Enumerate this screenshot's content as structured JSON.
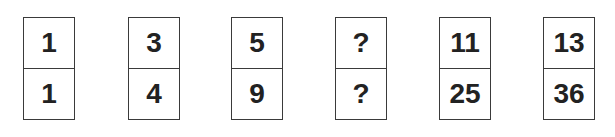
{
  "puzzle": {
    "dominoes": [
      {
        "top": "1",
        "bottom": "1"
      },
      {
        "top": "3",
        "bottom": "4"
      },
      {
        "top": "5",
        "bottom": "9"
      },
      {
        "top": "?",
        "bottom": "?"
      },
      {
        "top": "11",
        "bottom": "25"
      },
      {
        "top": "13",
        "bottom": "36"
      }
    ]
  }
}
